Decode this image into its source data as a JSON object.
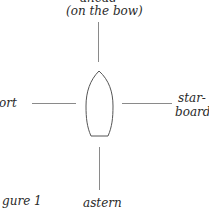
{
  "diagram": {
    "labels": {
      "ahead": "ahead",
      "on_the_bow": "(on the bow)",
      "port": "ort",
      "starboard_1": "star-",
      "starboard_2": "board",
      "astern": "astern",
      "figure": "gure 1"
    },
    "colors": {
      "line": "#8a8a8a",
      "text": "#2a2a2a",
      "background": "#ffffff"
    }
  }
}
